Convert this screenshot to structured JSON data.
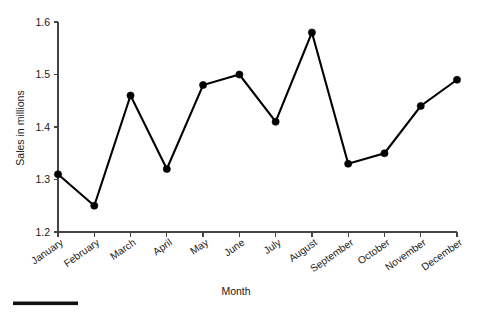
{
  "chart_data": {
    "type": "line",
    "title": "",
    "xlabel": "Month",
    "ylabel": "Sales in millions",
    "categories": [
      "January",
      "February",
      "March",
      "April",
      "May",
      "June",
      "July",
      "August",
      "September",
      "October",
      "November",
      "December"
    ],
    "values": [
      1.31,
      1.25,
      1.46,
      1.32,
      1.48,
      1.5,
      1.41,
      1.58,
      1.33,
      1.35,
      1.44,
      1.49
    ],
    "series": [
      {
        "name": "Sales",
        "values": [
          1.31,
          1.25,
          1.46,
          1.32,
          1.48,
          1.5,
          1.41,
          1.58,
          1.33,
          1.35,
          1.44,
          1.49
        ]
      }
    ],
    "ylim": [
      1.2,
      1.6
    ],
    "yticks": [
      1.2,
      1.3,
      1.4,
      1.5,
      1.6
    ],
    "ytick_labels": [
      "1.2",
      "1.3",
      "1.4",
      "1.5",
      "1.6"
    ],
    "grid": false,
    "legend": false,
    "legend_position": "none",
    "line_color": "#000000",
    "marker": "circle",
    "marker_color": "#000000",
    "axis_color": "#444444",
    "background_color": "#ffffff",
    "xtick_label_rotation": 35
  },
  "figure": {
    "footer_rule_color": "#111111"
  }
}
